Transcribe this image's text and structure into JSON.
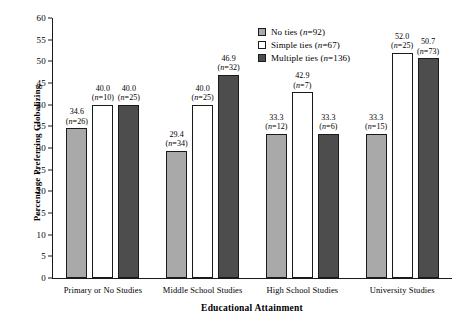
{
  "chart_data": {
    "type": "bar",
    "title": "",
    "xlabel": "Educational Attainment",
    "ylabel": "Percentage Preferring Globalizing",
    "ylim": [
      0,
      60
    ],
    "yticks": [
      0,
      5,
      10,
      15,
      20,
      25,
      30,
      35,
      40,
      45,
      50,
      55,
      60
    ],
    "grid": false,
    "legend_position": "top-right",
    "categories": [
      "Primary or No Studies",
      "Middle School Studies",
      "High School Studies",
      "University Studies"
    ],
    "series": [
      {
        "name": "No ties",
        "legend_label": "No ties (n=92)",
        "n_total": 92,
        "color": "#a9a9a9",
        "values": [
          34.6,
          29.4,
          33.3,
          33.3
        ],
        "counts": [
          26,
          34,
          12,
          15
        ],
        "labels": [
          "34.6",
          "29.4",
          "33.3",
          "33.3"
        ],
        "count_labels": [
          "(n=26)",
          "(n=34)",
          "(n=12)",
          "(n=15)"
        ]
      },
      {
        "name": "Simple ties",
        "legend_label": "Simple ties (n=67)",
        "n_total": 67,
        "color": "#ffffff",
        "values": [
          40.0,
          40.0,
          42.9,
          52.0
        ],
        "counts": [
          10,
          25,
          7,
          25
        ],
        "labels": [
          "40.0",
          "40.0",
          "42.9",
          "52.0"
        ],
        "count_labels": [
          "(n=10)",
          "(n=25)",
          "(n=7)",
          "(n=25)"
        ]
      },
      {
        "name": "Multiple ties",
        "legend_label": "Multiple ties (n=136)",
        "n_total": 136,
        "color": "#4d4d4d",
        "values": [
          40.0,
          46.9,
          33.3,
          50.7
        ],
        "counts": [
          25,
          32,
          6,
          73
        ],
        "labels": [
          "40.0",
          "46.9",
          "33.3",
          "50.7"
        ],
        "count_labels": [
          "(n=25)",
          "(n=32)",
          "(n=6)",
          "(n=73)"
        ]
      }
    ]
  },
  "legend": {
    "items": [
      {
        "label": "No ties",
        "n": "(n=92)"
      },
      {
        "label": "Simple ties",
        "n": "(n=67)"
      },
      {
        "label": "Multiple ties",
        "n": "(n=136)"
      }
    ]
  }
}
